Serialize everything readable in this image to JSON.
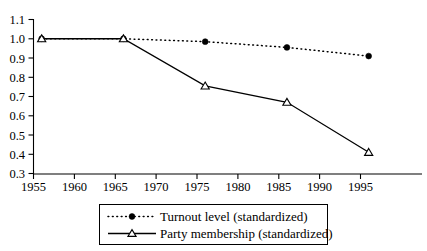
{
  "chart_data": {
    "type": "line",
    "title": "",
    "subtitle": "",
    "xlabel": "",
    "ylabel": "",
    "xlim": [
      1955,
      1999
    ],
    "ylim": [
      0.3,
      1.1
    ],
    "grid": false,
    "legend_position": "bottom",
    "x_ticks": [
      "1955",
      "1960",
      "1965",
      "1970",
      "1975",
      "1980",
      "1985",
      "1990",
      "1995"
    ],
    "x_tick_values": [
      1955,
      1960,
      1965,
      1970,
      1975,
      1980,
      1985,
      1990,
      1995
    ],
    "y_ticks": [
      "0.3",
      "0.4",
      "0.5",
      "0.6",
      "0.7",
      "0.8",
      "0.9",
      "1.0",
      "1.1"
    ],
    "y_tick_values": [
      0.3,
      0.4,
      0.5,
      0.6,
      0.7,
      0.8,
      0.9,
      1.0,
      1.1
    ],
    "x": [
      1956,
      1966,
      1976,
      1986,
      1996
    ],
    "series": [
      {
        "name": "Turnout level (standardized)",
        "marker": "filled-circle",
        "line_style": "dotted",
        "color": "#000000",
        "values": [
          1.0,
          1.0,
          0.985,
          0.955,
          0.91
        ]
      },
      {
        "name": "Party membership (standardized)",
        "marker": "open-triangle",
        "line_style": "solid",
        "color": "#000000",
        "values": [
          1.0,
          1.0,
          0.755,
          0.67,
          0.41
        ]
      }
    ]
  },
  "legend": {
    "entries": [
      {
        "label": "Turnout level (standardized)"
      },
      {
        "label": "Party membership (standardized)"
      }
    ]
  },
  "colors": {
    "ink": "#000000",
    "background": "#ffffff"
  }
}
